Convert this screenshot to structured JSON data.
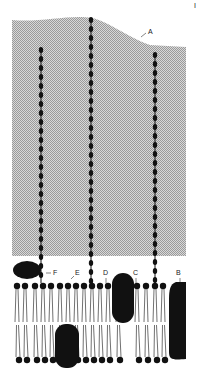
{
  "diagram": {
    "type": "cell membrane (fluid mosaic model)",
    "labels": {
      "A": "A",
      "B": "B",
      "C": "C",
      "D": "D",
      "E": "E",
      "F": "F"
    },
    "corner_mark": "I"
  }
}
